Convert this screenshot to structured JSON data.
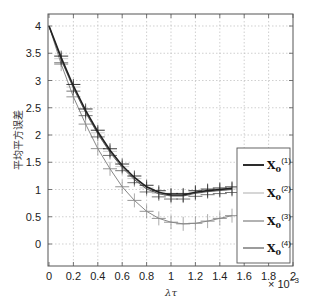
{
  "chart_data": {
    "type": "line",
    "title": "",
    "xlabel": "λτ",
    "ylabel": "平均平方误差",
    "x_scale_note": "× 10^-3",
    "xlim": [
      0,
      2
    ],
    "ylim": [
      -0.4,
      4.2
    ],
    "grid": true,
    "legend_position": "lower right",
    "x_ticks": [
      "0",
      "0.2",
      "0.4",
      "0.6",
      "0.8",
      "1",
      "1.2",
      "1.4",
      "1.6",
      "1.8",
      "2"
    ],
    "y_ticks": [
      "0",
      "0.5",
      "1",
      "1.5",
      "2",
      "2.5",
      "3",
      "3.5",
      "4"
    ],
    "x": [
      0,
      0.1,
      0.2,
      0.3,
      0.4,
      0.5,
      0.6,
      0.7,
      0.8,
      0.9,
      1.0,
      1.1,
      1.2,
      1.3,
      1.4,
      1.5
    ],
    "series": [
      {
        "name": "X0(1)",
        "color": "#222222",
        "width": 1.6,
        "values": [
          4.0,
          3.42,
          2.9,
          2.45,
          2.06,
          1.72,
          1.44,
          1.22,
          1.05,
          0.95,
          0.9,
          0.9,
          0.95,
          0.98,
          1.0,
          1.02
        ]
      },
      {
        "name": "X0(2)",
        "color": "#c8c8c8",
        "width": 1.2,
        "values": [
          4.0,
          3.4,
          2.88,
          2.43,
          2.04,
          1.7,
          1.42,
          1.2,
          1.03,
          0.93,
          0.89,
          0.89,
          0.94,
          0.97,
          0.99,
          1.01
        ]
      },
      {
        "name": "X0(3)",
        "color": "#888888",
        "width": 1.0,
        "values": [
          4.0,
          3.3,
          2.7,
          2.2,
          1.75,
          1.38,
          1.05,
          0.8,
          0.6,
          0.47,
          0.4,
          0.37,
          0.38,
          0.42,
          0.47,
          0.52
        ]
      },
      {
        "name": "X0(4)",
        "color": "#666666",
        "width": 1.0,
        "values": [
          4.0,
          3.38,
          2.86,
          2.41,
          2.02,
          1.68,
          1.4,
          1.18,
          1.01,
          0.92,
          0.88,
          0.88,
          0.93,
          0.96,
          0.98,
          1.0
        ]
      }
    ],
    "legend": [
      {
        "base": "X",
        "sub": "0",
        "sup": "(1)"
      },
      {
        "base": "X",
        "sub": "0",
        "sup": "(2)"
      },
      {
        "base": "X",
        "sub": "0",
        "sup": "(3)"
      },
      {
        "base": "X",
        "sub": "0",
        "sup": "(4)"
      }
    ]
  }
}
